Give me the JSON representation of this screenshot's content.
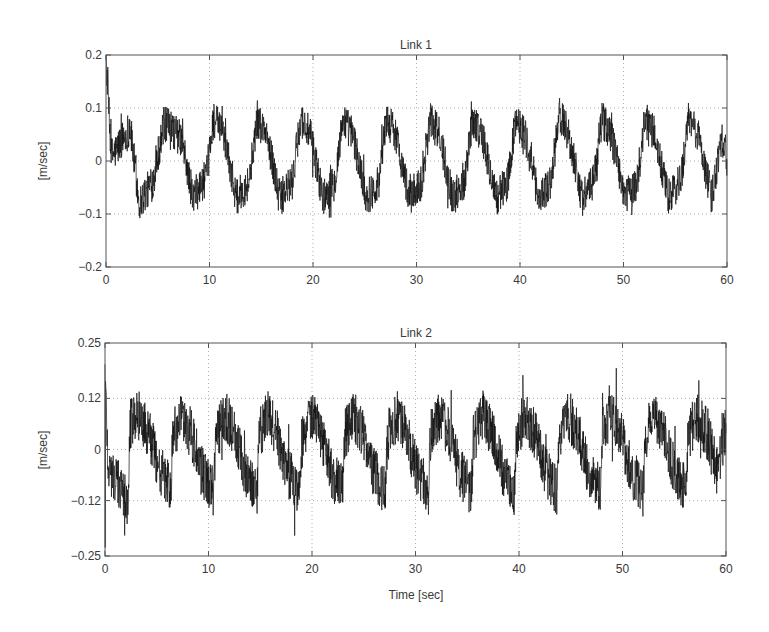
{
  "figure": {
    "xlabel": "Time [sec]"
  },
  "chart_data": [
    {
      "type": "line",
      "title": "Link 1",
      "xlabel": "",
      "ylabel": "[m/sec]",
      "xlim": [
        0,
        60
      ],
      "ylim": [
        -0.2,
        0.2
      ],
      "xticks": [
        0,
        10,
        20,
        30,
        40,
        50,
        60
      ],
      "xtick_labels": [
        "0",
        "10",
        "20",
        "30",
        "40",
        "50",
        "60"
      ],
      "yticks": [
        -0.2,
        -0.1,
        0,
        0.1,
        0.2
      ],
      "ytick_labels": [
        "-0.2",
        "-0.1",
        "0",
        "0.1",
        "0.2"
      ],
      "grid": true,
      "grid_style": "dotted",
      "legend": null,
      "series": [
        {
          "name": "Link 1 velocity",
          "color": "#111111",
          "description": "noisy periodic signal, ~14.5 cycles over 60 s, initial spike to ~0.2 at t=0",
          "period_sec": 4.15,
          "phase_sec": 3.2,
          "min_env": -0.09,
          "max_env": 0.085,
          "noise_amp": 0.035,
          "initial_spike": 0.2,
          "x": [
            0,
            0.5,
            1,
            1.5,
            2,
            2.3,
            3.2,
            4.5,
            5.6,
            6.4,
            7.3,
            8.4,
            9.7,
            10.4,
            11.4,
            12.6,
            13.8,
            14.6,
            15.5,
            16.8,
            18.0,
            18.8,
            19.7,
            21.0,
            22.1,
            22.9,
            23.8,
            25.2,
            26.3,
            27.1,
            28.0,
            29.3,
            30.5,
            31.3,
            32.2,
            33.5,
            34.6,
            35.4,
            36.3,
            37.7,
            38.8,
            39.6,
            40.5,
            41.8,
            43.0,
            43.8,
            44.7,
            46.0,
            47.1,
            47.9,
            48.8,
            50.2,
            51.3,
            52.1,
            53.0,
            54.3,
            55.5,
            56.3,
            57.2,
            58.5,
            59.5,
            60
          ],
          "y": [
            0.2,
            0.01,
            0.02,
            0.04,
            0.05,
            0.07,
            -0.08,
            -0.04,
            0.07,
            0.06,
            0.04,
            -0.07,
            -0.03,
            0.08,
            0.05,
            -0.07,
            -0.04,
            0.08,
            0.05,
            -0.07,
            -0.04,
            0.08,
            0.05,
            -0.07,
            -0.04,
            0.08,
            0.05,
            -0.07,
            -0.04,
            0.08,
            0.05,
            -0.07,
            -0.04,
            0.08,
            0.05,
            -0.07,
            -0.04,
            0.08,
            0.05,
            -0.07,
            -0.04,
            0.08,
            0.05,
            -0.07,
            -0.04,
            0.09,
            0.05,
            -0.07,
            -0.04,
            0.08,
            0.05,
            -0.07,
            -0.04,
            0.08,
            0.05,
            -0.07,
            -0.04,
            0.08,
            0.05,
            -0.07,
            0.05,
            0.0
          ]
        }
      ]
    },
    {
      "type": "line",
      "title": "Link 2",
      "xlabel": "Time [sec]",
      "ylabel": "[m/sec]",
      "xlim": [
        0,
        60
      ],
      "ylim": [
        -0.25,
        0.25
      ],
      "xticks": [
        0,
        10,
        20,
        30,
        40,
        50,
        60
      ],
      "xtick_labels": [
        "0",
        "10",
        "20",
        "30",
        "40",
        "50",
        "60"
      ],
      "yticks": [
        -0.25,
        -0.12,
        0,
        0.12,
        0.25
      ],
      "ytick_labels": [
        "-0.25",
        "-0.12",
        "0",
        "0.12",
        "0.25"
      ],
      "grid": true,
      "grid_style": "dotted",
      "legend": null,
      "series": [
        {
          "name": "Link 2 velocity",
          "color": "#111111",
          "description": "noisy sawtooth-like signal, ~14 cycles over 60 s, initial spikes to ~0.2 and ~-0.23 at t=0",
          "period_sec": 4.15,
          "phase_sec": 2.3,
          "min_env": -0.13,
          "max_env": 0.1,
          "noise_amp": 0.06,
          "initial_spike_up": 0.2,
          "initial_spike_down": -0.23,
          "x": [
            0,
            0.3,
            1.2,
            2.2,
            2.4,
            3.3,
            4.2,
            5.2,
            6.4,
            6.5,
            7.4,
            8.3,
            9.3,
            10.5,
            10.7,
            11.6,
            12.5,
            13.5,
            14.7,
            14.8,
            15.7,
            16.6,
            17.6,
            18.8,
            19.0,
            19.9,
            20.8,
            21.8,
            23.0,
            23.1,
            24.0,
            24.9,
            25.9,
            27.1,
            27.3,
            28.2,
            29.1,
            30.1,
            31.3,
            31.4,
            32.3,
            33.2,
            34.2,
            35.4,
            35.6,
            36.5,
            37.4,
            38.4,
            39.6,
            39.7,
            40.6,
            41.5,
            42.5,
            43.7,
            43.9,
            44.8,
            45.7,
            46.7,
            47.9,
            48.0,
            48.9,
            49.8,
            50.8,
            52.0,
            52.2,
            53.1,
            54.0,
            55.0,
            56.2,
            56.3,
            57.2,
            58.1,
            59.1,
            60
          ],
          "y": [
            0.2,
            -0.04,
            -0.08,
            -0.12,
            0.06,
            0.08,
            0.04,
            -0.04,
            -0.1,
            0.03,
            0.07,
            0.04,
            -0.05,
            -0.1,
            0.03,
            0.08,
            0.04,
            -0.05,
            -0.1,
            0.03,
            0.08,
            0.04,
            -0.05,
            -0.1,
            0.03,
            0.08,
            0.04,
            -0.05,
            -0.1,
            0.03,
            0.08,
            0.04,
            -0.05,
            -0.1,
            0.03,
            0.08,
            0.04,
            -0.05,
            -0.1,
            0.03,
            0.08,
            0.04,
            -0.05,
            -0.1,
            0.03,
            0.08,
            0.04,
            -0.05,
            -0.1,
            0.03,
            0.08,
            0.04,
            -0.05,
            -0.1,
            0.03,
            0.08,
            0.04,
            -0.05,
            -0.1,
            0.03,
            0.08,
            0.04,
            -0.05,
            -0.1,
            0.03,
            0.08,
            0.04,
            -0.05,
            -0.1,
            0.03,
            0.08,
            0.04,
            -0.05,
            0.05
          ]
        }
      ]
    }
  ],
  "layout": {
    "axes": [
      {
        "left": 106,
        "top": 55,
        "right": 727,
        "bottom": 267
      },
      {
        "left": 105,
        "top": 343,
        "right": 726,
        "bottom": 556
      }
    ],
    "colors": {
      "axis": "#555555",
      "grid": "#9a9a9a",
      "trace": "#111111"
    }
  }
}
